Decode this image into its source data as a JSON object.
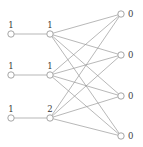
{
  "figure": {
    "background_color": "#ffffff",
    "edge_color": "#9a9a9a",
    "node_stroke_color": "#8f8f8f",
    "node_fill_color": "#ffffff",
    "label_color": "#3a3a3a",
    "width": 143,
    "height": 147
  },
  "chart_data": {
    "type": "diagram",
    "title": "",
    "layers": [
      {
        "name": "input-layer",
        "nodes": [
          {
            "id": "in-1",
            "label": "1",
            "x": 11,
            "y": 34
          },
          {
            "id": "in-2",
            "label": "1",
            "x": 11,
            "y": 75
          },
          {
            "id": "in-3",
            "label": "1",
            "x": 11,
            "y": 118
          }
        ]
      },
      {
        "name": "hidden-layer",
        "nodes": [
          {
            "id": "mid-1",
            "label": "1",
            "x": 50,
            "y": 34
          },
          {
            "id": "mid-2",
            "label": "1",
            "x": 50,
            "y": 75
          },
          {
            "id": "mid-3",
            "label": "2",
            "x": 50,
            "y": 118
          }
        ]
      },
      {
        "name": "output-layer",
        "nodes": [
          {
            "id": "out-1",
            "label": "0",
            "x": 121,
            "y": 14
          },
          {
            "id": "out-2",
            "label": "0",
            "x": 121,
            "y": 55
          },
          {
            "id": "out-3",
            "label": "0",
            "x": 121,
            "y": 96
          },
          {
            "id": "out-4",
            "label": "0",
            "x": 121,
            "y": 136
          }
        ]
      }
    ],
    "edges": [
      {
        "from": "in-1",
        "to": "mid-1"
      },
      {
        "from": "in-2",
        "to": "mid-2"
      },
      {
        "from": "in-3",
        "to": "mid-3"
      },
      {
        "from": "mid-1",
        "to": "out-1"
      },
      {
        "from": "mid-1",
        "to": "out-2"
      },
      {
        "from": "mid-1",
        "to": "out-3"
      },
      {
        "from": "mid-1",
        "to": "out-4"
      },
      {
        "from": "mid-2",
        "to": "out-1"
      },
      {
        "from": "mid-2",
        "to": "out-2"
      },
      {
        "from": "mid-2",
        "to": "out-3"
      },
      {
        "from": "mid-2",
        "to": "out-4"
      },
      {
        "from": "mid-3",
        "to": "out-1"
      },
      {
        "from": "mid-3",
        "to": "out-2"
      },
      {
        "from": "mid-3",
        "to": "out-3"
      },
      {
        "from": "mid-3",
        "to": "out-4"
      }
    ],
    "node_radius": 3.2,
    "label_offsets": {
      "above_dy": -6,
      "right_dx": 7,
      "right_dy": 3
    }
  }
}
